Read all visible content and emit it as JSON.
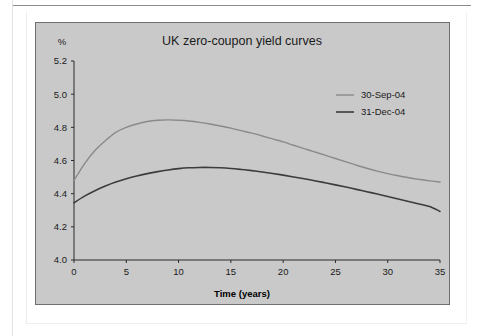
{
  "chart_data": {
    "type": "line",
    "title": "UK zero-coupon yield curves",
    "xlabel": "Time (years)",
    "ylabel": "%",
    "xlim": [
      0,
      35
    ],
    "ylim": [
      4.0,
      5.2
    ],
    "grid": false,
    "legend_position": "top-right",
    "xticks": [
      "0",
      "5",
      "10",
      "15",
      "20",
      "25",
      "30",
      "35"
    ],
    "xtick_values": [
      0,
      5,
      10,
      15,
      20,
      25,
      30,
      35
    ],
    "yticks": [
      "4.0",
      "4.2",
      "4.4",
      "4.6",
      "4.8",
      "5.0",
      "5.2"
    ],
    "ytick_values": [
      4.0,
      4.2,
      4.4,
      4.6,
      4.8,
      5.0,
      5.2
    ],
    "x": [
      0,
      1,
      2,
      3,
      4,
      5,
      6,
      7,
      8,
      9,
      10,
      11,
      12,
      13,
      14,
      15,
      16,
      17,
      18,
      19,
      20,
      21,
      22,
      23,
      24,
      25,
      26,
      27,
      28,
      29,
      30,
      31,
      32,
      33,
      34,
      35
    ],
    "series": [
      {
        "name": "30-Sep-04",
        "color": "#8a8a8a",
        "width": 1.4,
        "values": [
          4.48,
          4.58,
          4.66,
          4.72,
          4.77,
          4.8,
          4.82,
          4.835,
          4.843,
          4.845,
          4.843,
          4.838,
          4.83,
          4.82,
          4.808,
          4.795,
          4.78,
          4.765,
          4.748,
          4.73,
          4.712,
          4.692,
          4.672,
          4.652,
          4.632,
          4.612,
          4.592,
          4.572,
          4.553,
          4.536,
          4.521,
          4.508,
          4.496,
          4.486,
          4.477,
          4.47
        ]
      },
      {
        "name": "31-Dec-04",
        "color": "#3c3c3c",
        "width": 1.6,
        "values": [
          4.345,
          4.385,
          4.418,
          4.446,
          4.47,
          4.49,
          4.507,
          4.521,
          4.533,
          4.543,
          4.551,
          4.556,
          4.558,
          4.558,
          4.556,
          4.552,
          4.546,
          4.539,
          4.531,
          4.522,
          4.512,
          4.501,
          4.49,
          4.478,
          4.466,
          4.453,
          4.44,
          4.426,
          4.412,
          4.398,
          4.383,
          4.368,
          4.353,
          4.338,
          4.323,
          4.293
        ]
      }
    ]
  },
  "legend": {
    "items": [
      {
        "label": "30-Sep-04"
      },
      {
        "label": "31-Dec-04"
      }
    ]
  },
  "colors": {
    "panel_background": "#c9c9c9",
    "page_background": "#ffffff",
    "axis": "#2b2b2b",
    "series_1": "#8a8a8a",
    "series_2": "#3c3c3c"
  }
}
